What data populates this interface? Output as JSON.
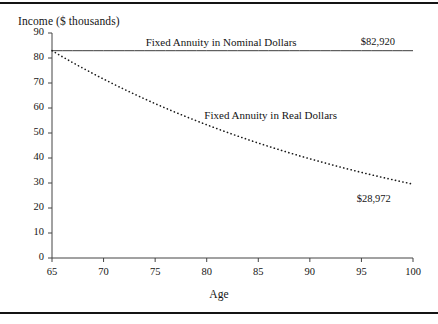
{
  "chart_data": {
    "type": "line",
    "title": "Income ($ thousands)",
    "xlabel": "Age",
    "ylabel": "",
    "xlim": [
      65,
      100
    ],
    "ylim": [
      0,
      90
    ],
    "grid": false,
    "legend_position": "inline-annotations",
    "xticks": [
      65,
      70,
      75,
      80,
      85,
      90,
      95,
      100
    ],
    "yticks": [
      0,
      10,
      20,
      30,
      40,
      50,
      60,
      70,
      80,
      90
    ],
    "xtick_labels": [
      "65",
      "70",
      "75",
      "80",
      "85",
      "90",
      "95",
      "100"
    ],
    "ytick_labels": [
      "0",
      "10",
      "20",
      "30",
      "40",
      "50",
      "60",
      "70",
      "80",
      "90"
    ],
    "x": [
      65,
      66,
      67,
      68,
      69,
      70,
      71,
      72,
      73,
      74,
      75,
      76,
      77,
      78,
      79,
      80,
      81,
      82,
      83,
      84,
      85,
      86,
      87,
      88,
      89,
      90,
      91,
      92,
      93,
      94,
      95,
      96,
      97,
      98,
      99,
      100
    ],
    "series": [
      {
        "name": "Fixed Annuity in Nominal Dollars",
        "style": "solid",
        "color": "#3c3c3c",
        "values": [
          82.92,
          82.92,
          82.92,
          82.92,
          82.92,
          82.92,
          82.92,
          82.92,
          82.92,
          82.92,
          82.92,
          82.92,
          82.92,
          82.92,
          82.92,
          82.92,
          82.92,
          82.92,
          82.92,
          82.92,
          82.92,
          82.92,
          82.92,
          82.92,
          82.92,
          82.92,
          82.92,
          82.92,
          82.92,
          82.92,
          82.92,
          82.92,
          82.92,
          82.92,
          82.92,
          82.92
        ],
        "end_value_label": "$82,920"
      },
      {
        "name": "Fixed Annuity in Real Dollars",
        "style": "dotted",
        "color": "#1a1a1a",
        "values": [
          82.92,
          80.51,
          78.17,
          75.91,
          73.71,
          71.57,
          69.49,
          67.47,
          65.51,
          63.61,
          61.76,
          59.96,
          58.22,
          56.53,
          54.89,
          53.29,
          51.74,
          50.24,
          48.78,
          47.36,
          45.98,
          44.65,
          43.35,
          42.09,
          40.87,
          39.68,
          38.53,
          37.41,
          36.32,
          35.27,
          34.24,
          33.25,
          32.28,
          31.34,
          30.43,
          29.54
        ],
        "end_value_label": "$28,972"
      }
    ],
    "annotations": [
      {
        "text": "Fixed Annuity in Nominal Dollars",
        "x": 81.4,
        "y": 85.5
      },
      {
        "text": "$82,920",
        "x": 96.6,
        "y": 85.5
      },
      {
        "text": "Fixed Annuity in Real Dollars",
        "x": 86.2,
        "y": 56.5
      },
      {
        "text": "$28,972",
        "x": 96.2,
        "y": 23.0
      }
    ]
  },
  "colors": {
    "frame_rule": "#141414",
    "axis": "#444444",
    "nominal_line": "#3c3c3c",
    "real_line": "#1a1a1a",
    "background": "#ffffff",
    "text": "#141414"
  }
}
